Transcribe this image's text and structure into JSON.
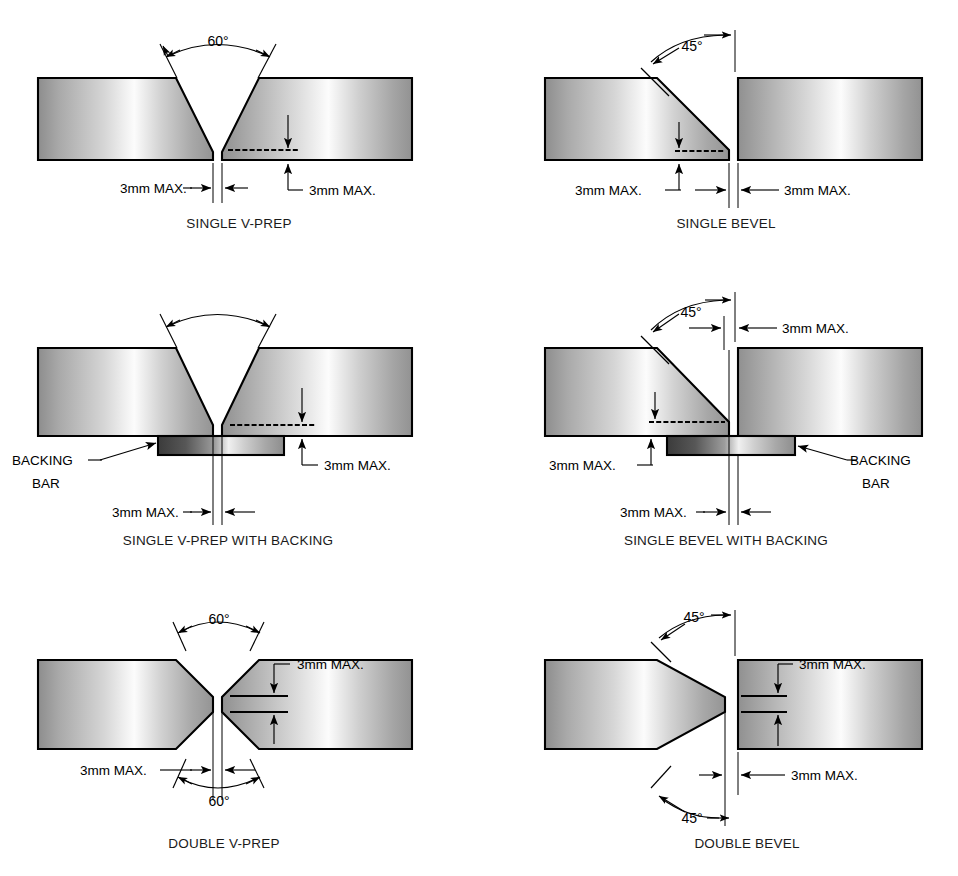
{
  "figure": {
    "background_color": "#ffffff",
    "line_color": "#000000",
    "plate_gradient": [
      "#8f8f8f",
      "#b3b3b3",
      "#fbfbfb",
      "#c9c9c9",
      "#9a9a9a"
    ],
    "backing_gradient": [
      "#3a3a3a",
      "#6e6e6e",
      "#f2f2f2",
      "#cfcfcf",
      "#8a8a8a"
    ]
  },
  "labels": {
    "gap_3mm": "3mm MAX.",
    "root_3mm": "3mm MAX.",
    "angle_60": "60°",
    "angle_45": "45°",
    "backing_bar_line1": "BACKING",
    "backing_bar_line2": "BAR"
  },
  "panels": [
    {
      "id": "single-v-prep",
      "caption": "SINGLE V-PREP",
      "angle": "60°",
      "root_gap": "3mm MAX.",
      "root_face": "3mm MAX.",
      "has_backing": false,
      "bevel_type": "v",
      "sides": "single"
    },
    {
      "id": "single-bevel",
      "caption": "SINGLE BEVEL",
      "angle": "45°",
      "root_gap": "3mm MAX.",
      "root_face": "3mm MAX.",
      "has_backing": false,
      "bevel_type": "bevel",
      "sides": "single"
    },
    {
      "id": "single-v-prep-with-backing",
      "caption": "SINGLE V-PREP WITH BACKING",
      "angle": "60°",
      "root_gap": "3mm MAX.",
      "root_face": "3mm MAX.",
      "has_backing": true,
      "backing_label_line1": "BACKING",
      "backing_label_line2": "BAR",
      "bevel_type": "v",
      "sides": "single"
    },
    {
      "id": "single-bevel-with-backing",
      "caption": "SINGLE BEVEL WITH BACKING",
      "angle": "45°",
      "root_gap": "3mm MAX.",
      "root_gap_top": "3mm MAX.",
      "root_face": "3mm MAX.",
      "has_backing": true,
      "backing_label_line1": "BACKING",
      "backing_label_line2": "BAR",
      "bevel_type": "bevel",
      "sides": "single"
    },
    {
      "id": "double-v-prep",
      "caption": "DOUBLE V-PREP",
      "angle_top": "60°",
      "angle_bottom": "60°",
      "root_gap": "3mm MAX.",
      "root_face": "3mm MAX.",
      "has_backing": false,
      "bevel_type": "v",
      "sides": "double"
    },
    {
      "id": "double-bevel",
      "caption": "DOUBLE BEVEL",
      "angle_top": "45°",
      "angle_bottom": "45°",
      "root_gap": "3mm MAX.",
      "root_face": "3mm MAX.",
      "has_backing": false,
      "bevel_type": "bevel",
      "sides": "double"
    }
  ]
}
